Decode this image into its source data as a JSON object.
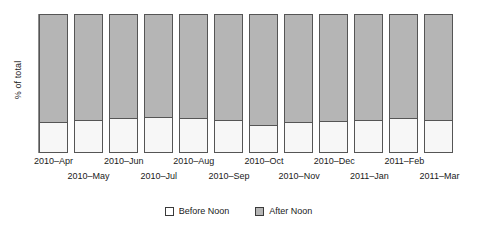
{
  "chart_data": {
    "type": "bar",
    "title": "",
    "subtitle": "",
    "xlabel": "",
    "ylabel": "% of total",
    "ylim": [
      0,
      100
    ],
    "grid": false,
    "stacked": true,
    "stack_mode": "percent",
    "legend_position": "bottom-center",
    "categories": [
      "2010–Apr",
      "2010–May",
      "2010–Jun",
      "2010–Jul",
      "2010–Aug",
      "2010–Sep",
      "2010–Oct",
      "2010–Nov",
      "2010–Dec",
      "2011–Jan",
      "2011–Feb",
      "2011–Mar"
    ],
    "series": [
      {
        "name": "Before Noon",
        "color": "#f7f7f7",
        "values": [
          22,
          24,
          25,
          26,
          25,
          24,
          20,
          22,
          23,
          24,
          25,
          24
        ]
      },
      {
        "name": "After Noon",
        "color": "#b5b5b5",
        "values": [
          78,
          76,
          75,
          74,
          75,
          76,
          80,
          78,
          77,
          76,
          75,
          76
        ]
      }
    ],
    "axis_tick_labels_row_top": [
      "2010–Apr",
      "2010–Jun",
      "2010–Aug",
      "2010–Oct",
      "2010–Dec",
      "2011–Feb"
    ],
    "axis_tick_labels_row_bottom": [
      "2010–May",
      "2010–Jul",
      "2010–Sep",
      "2010–Nov",
      "2011–Jan",
      "2011–Mar"
    ]
  },
  "legend": {
    "items": [
      {
        "label": "Before Noon",
        "swatch": "white-square-swatch"
      },
      {
        "label": "After Noon",
        "swatch": "gray-square-swatch"
      }
    ]
  },
  "colors": {
    "before_noon": "#f7f7f7",
    "after_noon": "#b5b5b5",
    "bar_outline": "#555555",
    "axis": "#8c8c8c",
    "text": "#1a1a1a",
    "background": "#ffffff"
  }
}
